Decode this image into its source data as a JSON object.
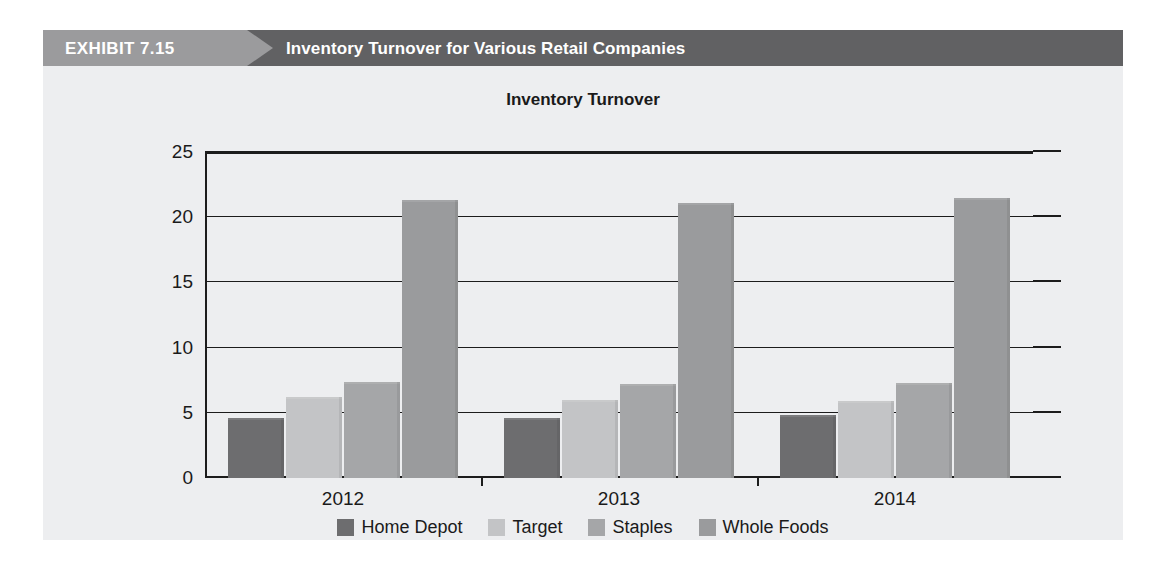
{
  "exhibit": {
    "label": "EXHIBIT 7.15",
    "title": "Inventory Turnover for Various Retail Companies",
    "banner_left_color": "#9b9b9d",
    "banner_right_color": "#616163",
    "background_color": "#edeef0"
  },
  "chart_data": {
    "type": "bar",
    "title": "Inventory Turnover",
    "xlabel": "",
    "ylabel": "",
    "categories": [
      "2012",
      "2013",
      "2014"
    ],
    "series": [
      {
        "name": "Home Depot",
        "color": "#6d6d6f",
        "values": [
          4.6,
          4.6,
          4.8
        ]
      },
      {
        "name": "Target",
        "color": "#c3c4c6",
        "values": [
          6.2,
          6.0,
          5.9
        ]
      },
      {
        "name": "Staples",
        "color": "#a5a6a8",
        "values": [
          7.4,
          7.2,
          7.3
        ]
      },
      {
        "name": "Whole Foods",
        "color": "#9a9b9d",
        "values": [
          21.3,
          21.1,
          21.5
        ]
      }
    ],
    "ylim": [
      0,
      25
    ],
    "yticks": [
      0,
      5,
      10,
      15,
      20,
      25
    ],
    "ytick_labels": [
      "0",
      "5",
      "10",
      "15",
      "20",
      "25"
    ],
    "grid": true,
    "legend_position": "bottom"
  }
}
